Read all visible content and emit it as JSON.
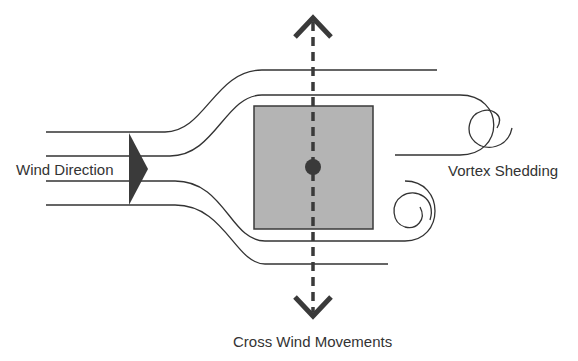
{
  "diagram": {
    "labels": {
      "wind_direction": "Wind Direction",
      "vortex_shedding": "Vortex Shedding",
      "cross_wind": "Cross Wind Movements"
    },
    "colors": {
      "line": "#333333",
      "body_fill": "#b4b4b4",
      "body_stroke": "#3a3a3a",
      "arrow": "#3a3a3a",
      "background": "#ffffff"
    }
  }
}
